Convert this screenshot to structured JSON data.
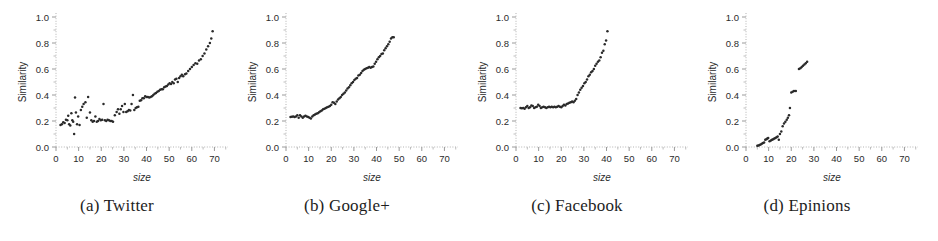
{
  "figure": {
    "panel_count": 4
  },
  "panels": [
    {
      "caption": "(a) Twitter",
      "name": "Twitter",
      "xlabel": "size",
      "ylabel": "Similarity"
    },
    {
      "caption": "(b) Google+",
      "name": "Google+",
      "xlabel": "size",
      "ylabel": "Similarity"
    },
    {
      "caption": "(c) Facebook",
      "name": "Facebook",
      "xlabel": "size",
      "ylabel": "Similarity"
    },
    {
      "caption": "(d) Epinions",
      "name": "Epinions",
      "xlabel": "size",
      "ylabel": "Similarity"
    }
  ],
  "axes": {
    "xticks": [
      0,
      10,
      20,
      30,
      40,
      50,
      60,
      70
    ],
    "xtick_labels": [
      "0",
      "10",
      "20",
      "30",
      "40",
      "50",
      "60",
      "70"
    ],
    "yticks": [
      0.0,
      0.2,
      0.4,
      0.6,
      0.8,
      1.0
    ],
    "ytick_labels": [
      "0.0",
      "0.2",
      "0.4",
      "0.6",
      "0.8",
      "1.0"
    ],
    "xlim": [
      0,
      76
    ],
    "ylim": [
      0,
      1.0
    ]
  },
  "colors": {
    "marker": "#2a2a2a",
    "axis": "#b4b4b4",
    "text": "#2b2b2b",
    "caption": "#1d1d1d",
    "background": "#ffffff"
  },
  "chart_data": [
    {
      "type": "scatter",
      "title": "(a) Twitter",
      "xlabel": "size",
      "ylabel": "Similarity",
      "xlim": [
        0,
        76
      ],
      "ylim": [
        0,
        1.0
      ],
      "grid": false,
      "legend": null,
      "points": [
        [
          2,
          0.17
        ],
        [
          2.6,
          0.175
        ],
        [
          3.2,
          0.19
        ],
        [
          3.8,
          0.185
        ],
        [
          4.4,
          0.21
        ],
        [
          5,
          0.205
        ],
        [
          5.4,
          0.24
        ],
        [
          5.8,
          0.175
        ],
        [
          6.3,
          0.165
        ],
        [
          6.8,
          0.26
        ],
        [
          7.2,
          0.205
        ],
        [
          7.6,
          0.195
        ],
        [
          8,
          0.1
        ],
        [
          8.4,
          0.38
        ],
        [
          8.8,
          0.265
        ],
        [
          9.3,
          0.175
        ],
        [
          9.8,
          0.235
        ],
        [
          10.4,
          0.17
        ],
        [
          11,
          0.285
        ],
        [
          11.6,
          0.31
        ],
        [
          12.2,
          0.33
        ],
        [
          13,
          0.345
        ],
        [
          13.6,
          0.225
        ],
        [
          14.2,
          0.385
        ],
        [
          15,
          0.265
        ],
        [
          15.6,
          0.205
        ],
        [
          16.2,
          0.195
        ],
        [
          16.8,
          0.2
        ],
        [
          17.4,
          0.235
        ],
        [
          18,
          0.195
        ],
        [
          18.6,
          0.2
        ],
        [
          19.2,
          0.215
        ],
        [
          19.8,
          0.205
        ],
        [
          20.4,
          0.21
        ],
        [
          21,
          0.33
        ],
        [
          21.6,
          0.205
        ],
        [
          22.2,
          0.2
        ],
        [
          22.8,
          0.21
        ],
        [
          23.4,
          0.205
        ],
        [
          24,
          0.2
        ],
        [
          24.6,
          0.2
        ],
        [
          25.2,
          0.195
        ],
        [
          26,
          0.245
        ],
        [
          26.8,
          0.27
        ],
        [
          27.4,
          0.29
        ],
        [
          28,
          0.255
        ],
        [
          28.6,
          0.29
        ],
        [
          29.2,
          0.315
        ],
        [
          29.8,
          0.27
        ],
        [
          30.4,
          0.33
        ],
        [
          31,
          0.27
        ],
        [
          31.6,
          0.275
        ],
        [
          32.2,
          0.285
        ],
        [
          32.8,
          0.28
        ],
        [
          33.4,
          0.33
        ],
        [
          34,
          0.4
        ],
        [
          34.6,
          0.285
        ],
        [
          35.2,
          0.3
        ],
        [
          35.8,
          0.305
        ],
        [
          36.4,
          0.31
        ],
        [
          37,
          0.355
        ],
        [
          37.6,
          0.36
        ],
        [
          38.2,
          0.375
        ],
        [
          38.8,
          0.375
        ],
        [
          39.4,
          0.39
        ],
        [
          40,
          0.385
        ],
        [
          40.6,
          0.385
        ],
        [
          41.2,
          0.38
        ],
        [
          41.8,
          0.385
        ],
        [
          42.4,
          0.39
        ],
        [
          43,
          0.4
        ],
        [
          43.6,
          0.41
        ],
        [
          44.2,
          0.415
        ],
        [
          44.8,
          0.425
        ],
        [
          45.4,
          0.43
        ],
        [
          46,
          0.44
        ],
        [
          46.6,
          0.445
        ],
        [
          47.2,
          0.445
        ],
        [
          47.8,
          0.46
        ],
        [
          48.4,
          0.465
        ],
        [
          49,
          0.47
        ],
        [
          49.6,
          0.48
        ],
        [
          50.2,
          0.49
        ],
        [
          50.8,
          0.485
        ],
        [
          51.4,
          0.5
        ],
        [
          52,
          0.49
        ],
        [
          52.6,
          0.52
        ],
        [
          53.2,
          0.525
        ],
        [
          53.8,
          0.5
        ],
        [
          54.4,
          0.53
        ],
        [
          55,
          0.545
        ],
        [
          55.6,
          0.555
        ],
        [
          56.2,
          0.545
        ],
        [
          57,
          0.56
        ],
        [
          57.6,
          0.565
        ],
        [
          58.4,
          0.585
        ],
        [
          59.2,
          0.6
        ],
        [
          60,
          0.615
        ],
        [
          60.8,
          0.63
        ],
        [
          61.6,
          0.645
        ],
        [
          62.4,
          0.64
        ],
        [
          63.2,
          0.665
        ],
        [
          64,
          0.675
        ],
        [
          64.8,
          0.7
        ],
        [
          65.6,
          0.72
        ],
        [
          66.4,
          0.75
        ],
        [
          67.2,
          0.775
        ],
        [
          68,
          0.8
        ],
        [
          68.6,
          0.835
        ],
        [
          69.2,
          0.89
        ]
      ]
    },
    {
      "type": "scatter",
      "title": "(b) Google+",
      "xlabel": "size",
      "ylabel": "Similarity",
      "xlim": [
        0,
        76
      ],
      "ylim": [
        0,
        1.0
      ],
      "grid": false,
      "legend": null,
      "points": [
        [
          2,
          0.23
        ],
        [
          2.6,
          0.232
        ],
        [
          3.2,
          0.235
        ],
        [
          3.8,
          0.23
        ],
        [
          4.4,
          0.235
        ],
        [
          5,
          0.245
        ],
        [
          5.6,
          0.225
        ],
        [
          6.2,
          0.245
        ],
        [
          6.8,
          0.235
        ],
        [
          7.4,
          0.225
        ],
        [
          8,
          0.235
        ],
        [
          8.6,
          0.24
        ],
        [
          9.2,
          0.235
        ],
        [
          9.8,
          0.23
        ],
        [
          10.4,
          0.225
        ],
        [
          11,
          0.22
        ],
        [
          11.6,
          0.235
        ],
        [
          12.2,
          0.245
        ],
        [
          12.8,
          0.25
        ],
        [
          13.4,
          0.255
        ],
        [
          14,
          0.26
        ],
        [
          14.6,
          0.268
        ],
        [
          15.2,
          0.275
        ],
        [
          15.8,
          0.28
        ],
        [
          16.4,
          0.29
        ],
        [
          17,
          0.295
        ],
        [
          17.6,
          0.3
        ],
        [
          18.2,
          0.305
        ],
        [
          18.8,
          0.31
        ],
        [
          19.4,
          0.315
        ],
        [
          20,
          0.325
        ],
        [
          20.6,
          0.345
        ],
        [
          21.2,
          0.34
        ],
        [
          21.8,
          0.33
        ],
        [
          22.4,
          0.35
        ],
        [
          23,
          0.365
        ],
        [
          23.6,
          0.375
        ],
        [
          24.2,
          0.385
        ],
        [
          24.8,
          0.4
        ],
        [
          25.4,
          0.41
        ],
        [
          26,
          0.42
        ],
        [
          26.6,
          0.435
        ],
        [
          27.2,
          0.45
        ],
        [
          27.8,
          0.46
        ],
        [
          28.4,
          0.475
        ],
        [
          29,
          0.49
        ],
        [
          29.6,
          0.5
        ],
        [
          30.2,
          0.515
        ],
        [
          30.8,
          0.525
        ],
        [
          31.4,
          0.53
        ],
        [
          32,
          0.55
        ],
        [
          32.6,
          0.555
        ],
        [
          33.2,
          0.57
        ],
        [
          33.8,
          0.585
        ],
        [
          34.4,
          0.595
        ],
        [
          35,
          0.6
        ],
        [
          35.6,
          0.605
        ],
        [
          36.2,
          0.61
        ],
        [
          36.8,
          0.615
        ],
        [
          37.4,
          0.61
        ],
        [
          38,
          0.615
        ],
        [
          38.6,
          0.62
        ],
        [
          39.2,
          0.64
        ],
        [
          39.8,
          0.655
        ],
        [
          40.4,
          0.675
        ],
        [
          41,
          0.69
        ],
        [
          41.6,
          0.7
        ],
        [
          42.2,
          0.715
        ],
        [
          42.8,
          0.72
        ],
        [
          43.4,
          0.745
        ],
        [
          44,
          0.76
        ],
        [
          44.6,
          0.775
        ],
        [
          45.2,
          0.79
        ],
        [
          45.8,
          0.81
        ],
        [
          46.4,
          0.835
        ],
        [
          47,
          0.845
        ],
        [
          47.6,
          0.845
        ]
      ]
    },
    {
      "type": "scatter",
      "title": "(c) Facebook",
      "xlabel": "size",
      "ylabel": "Similarity",
      "xlim": [
        0,
        76
      ],
      "ylim": [
        0,
        1.0
      ],
      "grid": false,
      "legend": null,
      "points": [
        [
          2,
          0.3
        ],
        [
          2.6,
          0.298
        ],
        [
          3.2,
          0.3
        ],
        [
          3.8,
          0.295
        ],
        [
          4.4,
          0.305
        ],
        [
          5,
          0.315
        ],
        [
          5.6,
          0.3
        ],
        [
          6.2,
          0.305
        ],
        [
          6.8,
          0.32
        ],
        [
          7.4,
          0.315
        ],
        [
          8,
          0.3
        ],
        [
          8.6,
          0.305
        ],
        [
          9.2,
          0.31
        ],
        [
          9.8,
          0.325
        ],
        [
          10.4,
          0.315
        ],
        [
          11,
          0.3
        ],
        [
          11.6,
          0.305
        ],
        [
          12.2,
          0.31
        ],
        [
          12.8,
          0.305
        ],
        [
          13.4,
          0.3
        ],
        [
          14,
          0.305
        ],
        [
          14.6,
          0.31
        ],
        [
          15.2,
          0.305
        ],
        [
          15.8,
          0.31
        ],
        [
          16.4,
          0.305
        ],
        [
          17,
          0.31
        ],
        [
          17.6,
          0.305
        ],
        [
          18.2,
          0.31
        ],
        [
          18.8,
          0.315
        ],
        [
          19.4,
          0.31
        ],
        [
          20,
          0.305
        ],
        [
          20.6,
          0.315
        ],
        [
          21.2,
          0.325
        ],
        [
          21.8,
          0.32
        ],
        [
          22.4,
          0.33
        ],
        [
          23,
          0.335
        ],
        [
          23.6,
          0.34
        ],
        [
          24.2,
          0.345
        ],
        [
          24.8,
          0.35
        ],
        [
          25.4,
          0.345
        ],
        [
          26,
          0.355
        ],
        [
          26.6,
          0.37
        ],
        [
          27.2,
          0.4
        ],
        [
          27.8,
          0.42
        ],
        [
          28.4,
          0.44
        ],
        [
          29,
          0.455
        ],
        [
          29.6,
          0.47
        ],
        [
          30.2,
          0.49
        ],
        [
          30.8,
          0.5
        ],
        [
          31.4,
          0.52
        ],
        [
          32,
          0.545
        ],
        [
          32.6,
          0.555
        ],
        [
          33.2,
          0.575
        ],
        [
          33.8,
          0.585
        ],
        [
          34.4,
          0.6
        ],
        [
          35,
          0.625
        ],
        [
          35.6,
          0.64
        ],
        [
          36.2,
          0.655
        ],
        [
          36.8,
          0.665
        ],
        [
          37.4,
          0.69
        ],
        [
          38,
          0.725
        ],
        [
          38.6,
          0.74
        ],
        [
          39.2,
          0.79
        ],
        [
          39.8,
          0.82
        ],
        [
          40.4,
          0.89
        ]
      ]
    },
    {
      "type": "scatter",
      "title": "(d) Epinions",
      "xlabel": "size",
      "ylabel": "Similarity",
      "xlim": [
        0,
        76
      ],
      "ylim": [
        0,
        1.0
      ],
      "grid": false,
      "legend": null,
      "points": [
        [
          5,
          0.01
        ],
        [
          5.5,
          0.012
        ],
        [
          6,
          0.015
        ],
        [
          6.5,
          0.02
        ],
        [
          7,
          0.025
        ],
        [
          7.5,
          0.03
        ],
        [
          8,
          0.035
        ],
        [
          8.5,
          0.055
        ],
        [
          9,
          0.06
        ],
        [
          9.4,
          0.065
        ],
        [
          9.8,
          0.07
        ],
        [
          10.4,
          0.045
        ],
        [
          11,
          0.05
        ],
        [
          11.5,
          0.055
        ],
        [
          12,
          0.06
        ],
        [
          12.5,
          0.065
        ],
        [
          13,
          0.07
        ],
        [
          13.5,
          0.075
        ],
        [
          14,
          0.08
        ],
        [
          14.5,
          0.055
        ],
        [
          15,
          0.1
        ],
        [
          15.6,
          0.12
        ],
        [
          16.2,
          0.16
        ],
        [
          16.8,
          0.18
        ],
        [
          17.4,
          0.195
        ],
        [
          18,
          0.21
        ],
        [
          18.5,
          0.225
        ],
        [
          19,
          0.245
        ],
        [
          19.4,
          0.3
        ],
        [
          20,
          0.42
        ],
        [
          20.6,
          0.425
        ],
        [
          21.2,
          0.43
        ],
        [
          22,
          0.43
        ],
        [
          23.4,
          0.6
        ],
        [
          24,
          0.605
        ],
        [
          24.6,
          0.615
        ],
        [
          25.2,
          0.625
        ],
        [
          25.8,
          0.635
        ],
        [
          26.4,
          0.645
        ],
        [
          27,
          0.655
        ]
      ]
    }
  ]
}
